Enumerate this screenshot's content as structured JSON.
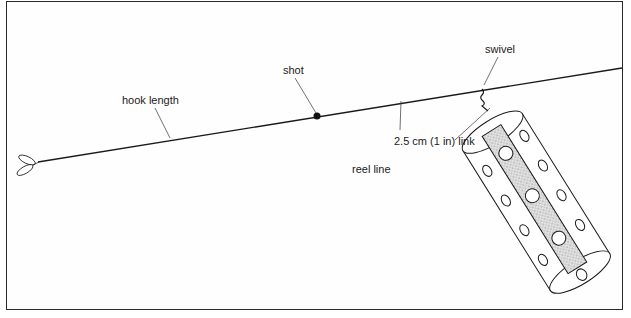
{
  "diagram": {
    "labels": {
      "hook_length": "hook length",
      "shot": "shot",
      "swivel": "swivel",
      "link": "2.5 cm (1 in) link",
      "reel_line": "reel line"
    },
    "colors": {
      "ink": "#1a1a1a",
      "border": "#2a2a2a",
      "feeder_fill": "#d6d6d6"
    }
  }
}
